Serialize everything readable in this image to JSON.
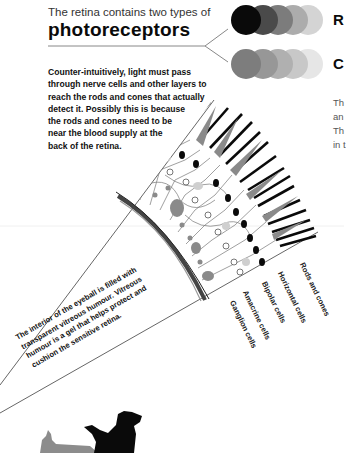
{
  "header": {
    "intro": "The retina contains two types of",
    "title": "photoreceptors"
  },
  "description": {
    "lines": [
      "Counter-intuitively, light must pass",
      "through nerve cells and other layers to",
      "reach the rods and cones that actually",
      "detect it. Possibly this is because",
      "the rods and cones need to be",
      "near the blood supply at the",
      "back of the retina."
    ]
  },
  "photoreceptor_types": [
    {
      "label_partial": "R",
      "colors": [
        "#0a0a0a",
        "#4a4a4a",
        "#7a7a7a",
        "#a8a8a8",
        "#d0d0d0"
      ]
    },
    {
      "label_partial": "C",
      "colors": [
        "#7d7d7d",
        "#959595",
        "#adadad",
        "#c6c6c6",
        "#e0e0e0"
      ]
    }
  ],
  "right_text_partial": [
    "Th",
    "an",
    "Th",
    "in t"
  ],
  "vitreous_note": {
    "lines": [
      "The interior of the eyeball is filled with",
      "transparent vitreous humour. Vitreous",
      "humour is a gel that helps protect and",
      "cushion the sensitive retina."
    ]
  },
  "layer_labels": [
    "Ganglion cells",
    "Amacrine cells",
    "Bipolar cells",
    "Horizontal cells",
    "Rods and cones"
  ],
  "colors": {
    "rod": "#0a0a0a",
    "cone": "#8a8a8a",
    "nerve": "#777777",
    "wall": "#555555"
  }
}
